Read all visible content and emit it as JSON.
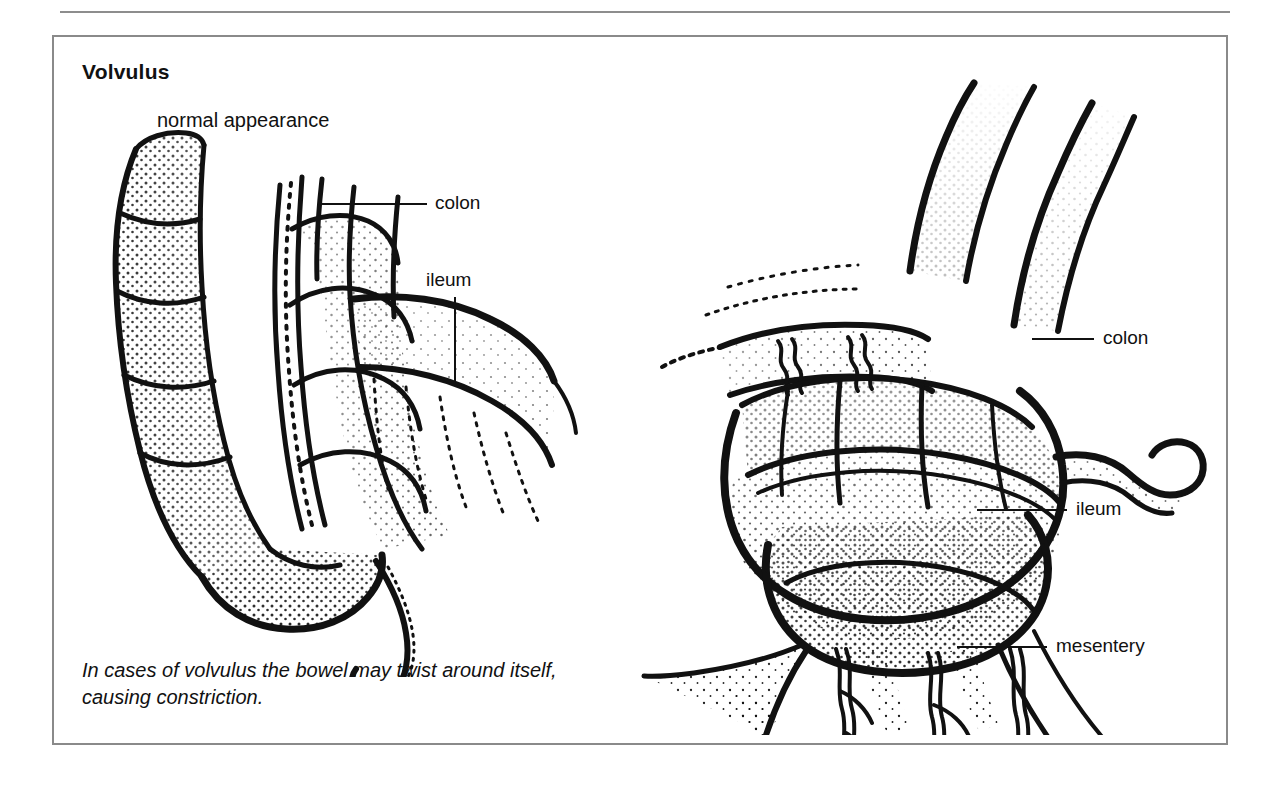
{
  "figure": {
    "title": "Volvulus",
    "subtitle": "normal appearance",
    "caption": "In cases of volvulus the bowel may twist around itself, causing constriction.",
    "frame_color": "#8a8a8a",
    "ink_color": "#111111",
    "background": "#ffffff"
  },
  "labels": {
    "left_colon": "colon",
    "left_ileum": "ileum",
    "right_colon": "colon",
    "right_ileum": "ileum",
    "right_mesentery": "mesentery"
  },
  "illustrations": [
    {
      "name": "normal-bowel-illustration",
      "caption_label": "normal appearance",
      "style": "stipple pen-and-ink line art",
      "parts": [
        "colon",
        "ileum",
        "caecum",
        "appendix",
        "taenia coli"
      ]
    },
    {
      "name": "volvulus-bowel-illustration",
      "style": "stipple pen-and-ink line art",
      "parts": [
        "colon",
        "ileum",
        "mesentery",
        "mesenteric vessels",
        "twisted loop"
      ]
    }
  ]
}
